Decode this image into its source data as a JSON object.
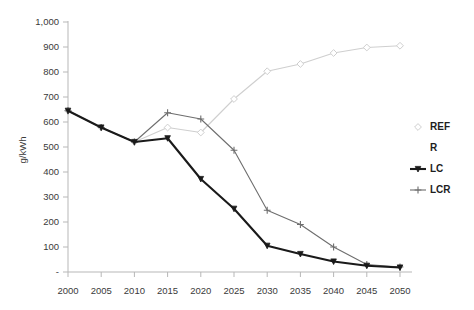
{
  "chart_data": {
    "type": "line",
    "title": "",
    "xlabel": "",
    "ylabel": "g/kWh",
    "x": [
      2000,
      2005,
      2010,
      2015,
      2020,
      2025,
      2030,
      2035,
      2040,
      2045,
      2050
    ],
    "xtick_labels": [
      "2000",
      "2005",
      "2010",
      "2015",
      "2020",
      "2025",
      "2030",
      "2035",
      "2040",
      "2045",
      "2050"
    ],
    "ytick_labels": [
      "-",
      "100",
      "200",
      "300",
      "400",
      "500",
      "600",
      "700",
      "800",
      "900",
      "1,000"
    ],
    "ytick_values": [
      0,
      100,
      200,
      300,
      400,
      500,
      600,
      700,
      800,
      900,
      1000
    ],
    "ylim": [
      0,
      1000
    ],
    "xlim": [
      2000,
      2050
    ],
    "grid": false,
    "legend_position": "right",
    "series": [
      {
        "name": "REF",
        "color": "#cfcfcf",
        "marker": "diamond-open",
        "values": [
          645,
          578,
          520,
          578,
          558,
          692,
          803,
          832,
          876,
          898,
          905
        ]
      },
      {
        "name": "R",
        "color": "#ffffff",
        "marker": "none",
        "values": [
          null,
          null,
          null,
          null,
          null,
          null,
          null,
          null,
          null,
          null,
          null
        ]
      },
      {
        "name": "LC",
        "color": "#1a1a1a",
        "marker": "triangle",
        "values": [
          645,
          578,
          520,
          535,
          372,
          253,
          105,
          72,
          42,
          25,
          18
        ]
      },
      {
        "name": "LCR",
        "color": "#6e6e6e",
        "marker": "cross",
        "values": [
          645,
          578,
          520,
          637,
          612,
          487,
          247,
          190,
          100,
          30,
          20
        ]
      }
    ],
    "legend": [
      {
        "label": "REF",
        "color": "#cfcfcf",
        "marker": "diamond-open"
      },
      {
        "label": "R",
        "color": "#ffffff",
        "marker": "none"
      },
      {
        "label": "LC",
        "color": "#1a1a1a",
        "marker": "triangle"
      },
      {
        "label": "LCR",
        "color": "#6e6e6e",
        "marker": "cross"
      }
    ]
  }
}
